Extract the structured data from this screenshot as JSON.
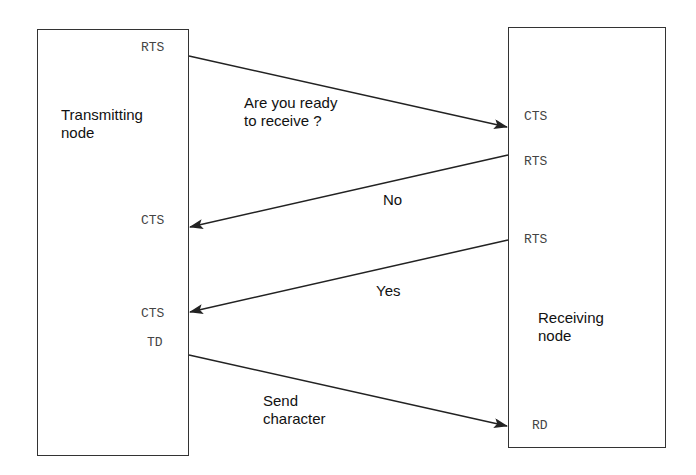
{
  "nodes": {
    "transmitter": {
      "label": "Transmitting\nnode",
      "pins": {
        "rts": "RTS",
        "cts1": "CTS",
        "cts2": "CTS",
        "td": "TD"
      }
    },
    "receiver": {
      "label": "Receiving\nnode",
      "pins": {
        "cts": "CTS",
        "rts1": "RTS",
        "rts2": "RTS",
        "rd": "RD"
      }
    }
  },
  "messages": [
    {
      "label": "Are you ready\nto receive ?",
      "from": "Transmitting node RTS",
      "to": "Receiving node CTS"
    },
    {
      "label": "No",
      "from": "Receiving node RTS",
      "to": "Transmitting node CTS"
    },
    {
      "label": "Yes",
      "from": "Receiving node RTS",
      "to": "Transmitting node CTS"
    },
    {
      "label": "Send\ncharacter",
      "from": "Transmitting node TD",
      "to": "Receiving node RD"
    }
  ],
  "colors": {
    "line": "#222222",
    "box_border": "#333333",
    "pin_text": "#444444"
  }
}
